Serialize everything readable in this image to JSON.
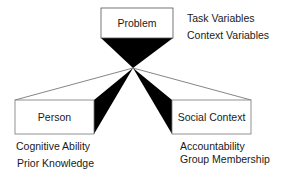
{
  "diagram": {
    "nodes": {
      "problem": {
        "label": "Problem",
        "attributes": [
          "Task Variables",
          "Context Variables"
        ]
      },
      "person": {
        "label": "Person",
        "attributes": [
          "Cognitive Ability",
          "Prior Knowledge"
        ]
      },
      "social_context": {
        "label": "Social Context",
        "attributes": [
          "Accountability",
          "Group Membership"
        ]
      }
    },
    "colors": {
      "stroke": "#555555",
      "fill_dark": "#000000",
      "box_fill": "#ffffff",
      "text": "#1a1a1a"
    }
  }
}
